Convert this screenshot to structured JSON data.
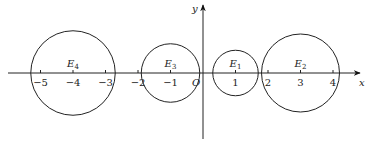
{
  "diagram": {
    "axes": {
      "x_label": "x",
      "y_label": "y",
      "origin_label": "O",
      "x_ticks": [
        {
          "value": -5,
          "label": "−5"
        },
        {
          "value": -4,
          "label": "−4"
        },
        {
          "value": -3,
          "label": "−3"
        },
        {
          "value": -2,
          "label": "−2"
        },
        {
          "value": -1,
          "label": "−1"
        },
        {
          "value": 1,
          "label": "1"
        },
        {
          "value": 2,
          "label": "2"
        },
        {
          "value": 3,
          "label": "3"
        },
        {
          "value": 4,
          "label": "4"
        }
      ]
    },
    "circles": [
      {
        "name": "E4",
        "label_base": "E",
        "label_sub": "4",
        "center_x": -4,
        "radius": 1.3
      },
      {
        "name": "E3",
        "label_base": "E",
        "label_sub": "3",
        "center_x": -1,
        "radius": 0.9
      },
      {
        "name": "E1",
        "label_base": "E",
        "label_sub": "1",
        "center_x": 1,
        "radius": 0.7
      },
      {
        "name": "E2",
        "label_base": "E",
        "label_sub": "2",
        "center_x": 3,
        "radius": 1.2
      }
    ]
  }
}
